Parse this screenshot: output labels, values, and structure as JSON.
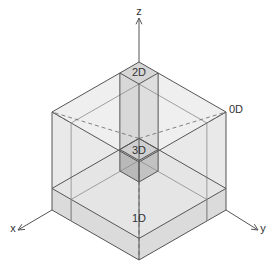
{
  "diagram": {
    "type": "isometric-cube-decomposition",
    "axes": {
      "x_label": "x",
      "y_label": "y",
      "z_label": "z"
    },
    "regions": {
      "corner_cube_label": "3D",
      "column_label": "2D",
      "slab_label": "1D",
      "outer_label": "0D"
    },
    "colors": {
      "edge": "#555555",
      "outer_face": "#e9e9e9",
      "column_face": "#d6d6d6",
      "slab_face": "#d9d9d9",
      "cube_face": "#b9b9b9",
      "axis": "#555555",
      "background": "#ffffff"
    },
    "inner_fraction": 0.22
  }
}
